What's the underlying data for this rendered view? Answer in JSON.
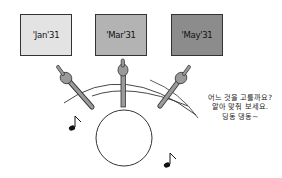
{
  "boxes": [
    {
      "label": "'Jan'31",
      "color": "#e3e3e3"
    },
    {
      "label": "'Mar'31",
      "color": "#b3b3b3"
    },
    {
      "label": "'May'31",
      "color": "#8c8c8c"
    }
  ],
  "pointer_color": "#999999",
  "caption": {
    "lines": [
      "어느 것을 고를까요?",
      "알아 맞춰 보세요.",
      "딩동 댕동~"
    ]
  },
  "music_notes": [
    "♪",
    "♪"
  ]
}
